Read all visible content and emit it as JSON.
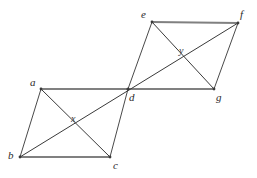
{
  "figure": {
    "width": 257,
    "height": 178,
    "background_color": "#ffffff",
    "edge_color": "#808080",
    "diagonal_color": "#3a3a3a",
    "label_color": "#2b2b2b"
  },
  "diagram_data": {
    "type": "geometric-diagram",
    "shapes": [
      {
        "name": "lower-parallelogram",
        "vertices": [
          "a",
          "d",
          "c",
          "b"
        ],
        "diagonal_intersection": "x"
      },
      {
        "name": "upper-parallelogram",
        "vertices": [
          "e",
          "f",
          "g",
          "d"
        ],
        "diagonal_intersection": "y"
      }
    ],
    "shared_vertex": "d",
    "points": [
      {
        "id": "a",
        "label": "a",
        "x": 41,
        "y": 89,
        "label_x": 30,
        "label_y": 77
      },
      {
        "id": "b",
        "label": "b",
        "x": 20,
        "y": 157,
        "label_x": 8,
        "label_y": 150
      },
      {
        "id": "c",
        "label": "c",
        "x": 110,
        "y": 157,
        "label_x": 113,
        "label_y": 160
      },
      {
        "id": "d",
        "label": "d",
        "x": 128,
        "y": 89,
        "label_x": 129,
        "label_y": 92
      },
      {
        "id": "e",
        "label": "e",
        "x": 152,
        "y": 22,
        "label_x": 141,
        "label_y": 9
      },
      {
        "id": "f",
        "label": "f",
        "x": 238,
        "y": 23,
        "label_x": 240,
        "label_y": 9
      },
      {
        "id": "g",
        "label": "g",
        "x": 214,
        "y": 89,
        "label_x": 216,
        "label_y": 92
      },
      {
        "id": "x",
        "label": "x",
        "x": 75,
        "y": 125,
        "label_x": 71,
        "label_y": 114
      },
      {
        "id": "y",
        "label": "y",
        "x": 183,
        "y": 58,
        "label_x": 179,
        "label_y": 46
      }
    ],
    "edges": [
      {
        "name": "edge-a-d",
        "from": "a",
        "to": "d",
        "style": "edge"
      },
      {
        "name": "edge-b-c",
        "from": "b",
        "to": "c",
        "style": "edge"
      },
      {
        "name": "edge-a-b",
        "from": "a",
        "to": "b",
        "style": "edge-thin"
      },
      {
        "name": "edge-d-c",
        "from": "d",
        "to": "c",
        "style": "edge-thin"
      },
      {
        "name": "edge-e-f",
        "from": "e",
        "to": "f",
        "style": "edge"
      },
      {
        "name": "edge-d-g",
        "from": "d",
        "to": "g",
        "style": "edge"
      },
      {
        "name": "edge-e-d",
        "from": "e",
        "to": "d",
        "style": "edge-thin"
      },
      {
        "name": "edge-f-g",
        "from": "f",
        "to": "g",
        "style": "edge-thin"
      }
    ],
    "diagonals": [
      {
        "name": "diagonal-a-c",
        "from": "a",
        "to": "c",
        "through": "x"
      },
      {
        "name": "diagonal-e-g",
        "from": "e",
        "to": "g",
        "through": "y"
      },
      {
        "name": "diagonal-d-f",
        "from": "d",
        "to": "f",
        "through": "y"
      },
      {
        "name": "diagonal-b-f",
        "from": "b",
        "to": "f",
        "through": "x, d, y"
      }
    ]
  }
}
